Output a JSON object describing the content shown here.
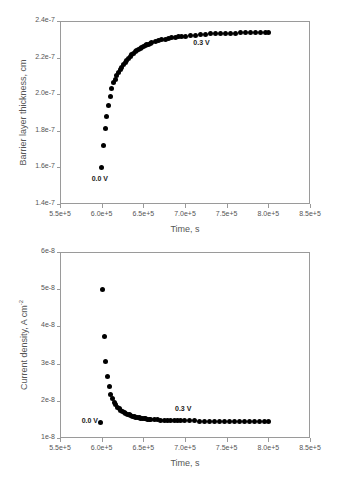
{
  "figure": {
    "panels": [
      {
        "id": "barrier-layer-thickness",
        "axis_title_x": "Time, s",
        "axis_title_y": "Barrier layer thickness, cm",
        "xticks": [
          "5.5e+5",
          "6.0e+5",
          "6.5e+5",
          "7.0e+5",
          "7.5e+5",
          "8.0e+5",
          "8.5e+5"
        ],
        "yticks": [
          "1.4e-7",
          "1.6e-7",
          "1.8e-7",
          "2.0e-7",
          "2.2e-7",
          "2.4e-7"
        ],
        "annotations": [
          {
            "label": "0.0 V"
          },
          {
            "label": "0.3 V"
          }
        ]
      },
      {
        "id": "current-density",
        "axis_title_x": "Time, s",
        "axis_title_y_main": "Current density, A cm",
        "axis_title_y_sup": "-2",
        "xticks": [
          "5.5e+5",
          "6.0e+5",
          "6.5e+5",
          "7.0e+5",
          "7.5e+5",
          "8.0e+5",
          "8.5e+5"
        ],
        "yticks": [
          "1e-8",
          "2e-8",
          "3e-8",
          "4e-8",
          "5e-8",
          "6e-8"
        ],
        "annotations": [
          {
            "label": "0.0 V"
          },
          {
            "label": "0.3 V"
          }
        ]
      }
    ]
  },
  "chart_data": [
    {
      "type": "scatter",
      "title": "",
      "xlabel": "Time, s",
      "ylabel": "Barrier layer thickness, cm",
      "xlim": [
        550000,
        850000
      ],
      "ylim": [
        1.4e-07,
        2.4e-07
      ],
      "xticks": [
        550000,
        600000,
        650000,
        700000,
        750000,
        800000,
        850000
      ],
      "yticks": [
        1.4e-07,
        1.6e-07,
        1.8e-07,
        2e-07,
        2.2e-07,
        2.4e-07
      ],
      "grid": false,
      "legend": false,
      "marker": "filled-circle",
      "marker_color": "#000000",
      "annotations": [
        {
          "text": "0.0 V",
          "x": 600000,
          "y": 1.535e-07
        },
        {
          "text": "0.3 V",
          "x": 722000,
          "y": 2.278e-07
        }
      ],
      "series": [
        {
          "name": "Barrier layer thickness",
          "x": [
            600000,
            602000,
            604000,
            606000,
            608000,
            610000,
            612000,
            614000,
            616000,
            618000,
            620000,
            622000,
            624000,
            626000,
            628000,
            630000,
            632000,
            634000,
            636000,
            638000,
            640000,
            642000,
            644000,
            646000,
            648000,
            650000,
            652000,
            654000,
            656000,
            658000,
            660000,
            664000,
            668000,
            672000,
            676000,
            680000,
            684000,
            688000,
            692000,
            696000,
            700000,
            706000,
            712000,
            718000,
            724000,
            730000,
            736000,
            742000,
            748000,
            754000,
            760000,
            766000,
            772000,
            778000,
            784000,
            790000,
            796000,
            800000
          ],
          "y": [
            1.6e-07,
            1.722e-07,
            1.81e-07,
            1.88e-07,
            1.938e-07,
            1.988e-07,
            2.032e-07,
            2.062e-07,
            2.082e-07,
            2.1e-07,
            2.118e-07,
            2.134e-07,
            2.148e-07,
            2.162e-07,
            2.174e-07,
            2.186e-07,
            2.197e-07,
            2.207e-07,
            2.216e-07,
            2.224e-07,
            2.232e-07,
            2.239e-07,
            2.245e-07,
            2.251e-07,
            2.257e-07,
            2.262e-07,
            2.266e-07,
            2.27e-07,
            2.274e-07,
            2.278e-07,
            2.281e-07,
            2.287e-07,
            2.292e-07,
            2.297e-07,
            2.301e-07,
            2.305e-07,
            2.308e-07,
            2.311e-07,
            2.314e-07,
            2.316e-07,
            2.318e-07,
            2.321e-07,
            2.323e-07,
            2.325e-07,
            2.327e-07,
            2.329e-07,
            2.33e-07,
            2.331e-07,
            2.332e-07,
            2.333e-07,
            2.334e-07,
            2.335e-07,
            2.335e-07,
            2.336e-07,
            2.336e-07,
            2.337e-07,
            2.337e-07,
            2.338e-07
          ]
        }
      ]
    },
    {
      "type": "scatter",
      "title": "",
      "xlabel": "Time, s",
      "ylabel": "Current density, A cm-2",
      "xlim": [
        550000,
        850000
      ],
      "ylim": [
        1e-08,
        6e-08
      ],
      "xticks": [
        550000,
        600000,
        650000,
        700000,
        750000,
        800000,
        850000
      ],
      "yticks": [
        1e-08,
        2e-08,
        3e-08,
        4e-08,
        5e-08,
        6e-08
      ],
      "grid": false,
      "legend": false,
      "marker": "filled-circle",
      "marker_color": "#000000",
      "annotations": [
        {
          "text": "0.0 V",
          "x": 588000,
          "y": 1.45e-08
        },
        {
          "text": "0.3 V",
          "x": 700000,
          "y": 1.78e-08
        }
      ],
      "series": [
        {
          "name": "Current density",
          "x": [
            599000,
            601000,
            603000,
            605000,
            607000,
            609000,
            611000,
            613000,
            615000,
            617000,
            619000,
            621000,
            623000,
            625000,
            627000,
            629000,
            631000,
            633000,
            635000,
            637000,
            639000,
            641000,
            643000,
            645000,
            647000,
            649000,
            651000,
            653000,
            655000,
            657000,
            659000,
            663000,
            667000,
            671000,
            675000,
            679000,
            683000,
            687000,
            691000,
            695000,
            699000,
            705000,
            711000,
            717000,
            723000,
            729000,
            735000,
            741000,
            747000,
            753000,
            759000,
            765000,
            771000,
            777000,
            783000,
            789000,
            795000,
            800000
          ],
          "y": [
            1.43e-08,
            5e-08,
            3.72e-08,
            3.05e-08,
            2.64e-08,
            2.38e-08,
            2.18e-08,
            2.05e-08,
            1.96e-08,
            1.89e-08,
            1.83e-08,
            1.78e-08,
            1.74e-08,
            1.71e-08,
            1.68e-08,
            1.66e-08,
            1.64e-08,
            1.62e-08,
            1.6e-08,
            1.585e-08,
            1.572e-08,
            1.56e-08,
            1.55e-08,
            1.542e-08,
            1.534e-08,
            1.527e-08,
            1.521e-08,
            1.515e-08,
            1.51e-08,
            1.505e-08,
            1.501e-08,
            1.494e-08,
            1.488e-08,
            1.483e-08,
            1.479e-08,
            1.475e-08,
            1.472e-08,
            1.469e-08,
            1.466e-08,
            1.464e-08,
            1.462e-08,
            1.459e-08,
            1.457e-08,
            1.455e-08,
            1.453e-08,
            1.452e-08,
            1.45e-08,
            1.449e-08,
            1.448e-08,
            1.447e-08,
            1.446e-08,
            1.445e-08,
            1.444e-08,
            1.444e-08,
            1.443e-08,
            1.443e-08,
            1.442e-08,
            1.442e-08
          ]
        }
      ]
    }
  ]
}
